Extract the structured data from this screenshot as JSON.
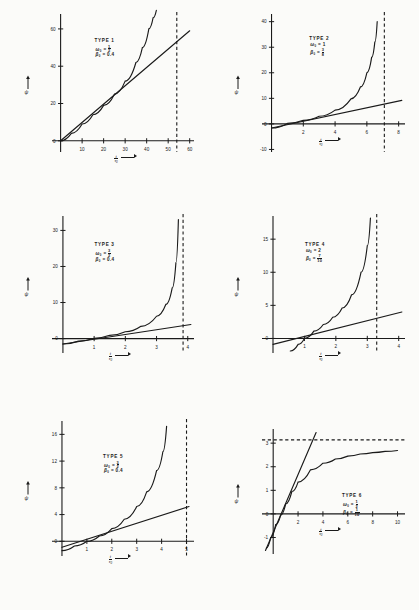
{
  "figure": {
    "kind": "six-panel-scientific-plot",
    "axis": {
      "x_label_main": "t",
      "x_label_sub": "0",
      "x_label_denom": "τ",
      "y_label": "ψ",
      "arrow": "→"
    },
    "ink": "#1a1a1a",
    "paper": "#fbfbf9"
  },
  "chart_data": [
    {
      "type": "line",
      "title": "TYPE 1",
      "params": {
        "omega0": "1/2",
        "beta0": "0.4"
      },
      "xlabel": "t/τ0",
      "ylabel": "ψ",
      "xlim": [
        -4,
        62
      ],
      "ylim": [
        -6,
        68
      ],
      "xticks": [
        10,
        20,
        30,
        40,
        50,
        60
      ],
      "yticks": [
        0,
        20,
        40,
        60
      ],
      "asymptote_type": "vertical",
      "asymptote_value": 54,
      "series": [
        {
          "name": "curve",
          "x": [
            0,
            5,
            10,
            15,
            20,
            25,
            30,
            35,
            38,
            41,
            43,
            44.5
          ],
          "y": [
            0,
            4,
            9,
            14,
            19,
            25,
            32,
            42,
            50,
            60,
            66,
            70
          ]
        },
        {
          "name": "line",
          "x": [
            0,
            60
          ],
          "y": [
            0,
            59
          ]
        }
      ]
    },
    {
      "type": "line",
      "title": "TYPE 2",
      "params": {
        "omega0": "1",
        "beta0": "3/8"
      },
      "xlabel": "t/τ0",
      "ylabel": "ψ",
      "xlim": [
        -0.6,
        8.4
      ],
      "ylim": [
        -11,
        43
      ],
      "xticks": [
        2,
        4,
        6,
        8
      ],
      "yticks": [
        -10,
        0,
        10,
        20,
        30,
        40
      ],
      "asymptote_type": "vertical",
      "asymptote_value": 7.1,
      "series": [
        {
          "name": "curve",
          "x": [
            0,
            1,
            2,
            3,
            4,
            5,
            5.6,
            6,
            6.3,
            6.5,
            6.65
          ],
          "y": [
            -1.6,
            0.2,
            1.4,
            3.0,
            5.4,
            9.8,
            14.5,
            20,
            26,
            32,
            40
          ]
        },
        {
          "name": "line",
          "x": [
            0,
            8.2
          ],
          "y": [
            -1.6,
            9.2
          ]
        }
      ]
    },
    {
      "type": "line",
      "title": "TYPE 3",
      "params": {
        "omega0": "3/2",
        "beta0": "0.4"
      },
      "xlabel": "t/τ0",
      "ylabel": "ψ",
      "xlim": [
        -0.35,
        4.2
      ],
      "ylim": [
        -4,
        34
      ],
      "xticks": [
        1,
        2,
        3,
        4
      ],
      "yticks": [
        0,
        10,
        20,
        30
      ],
      "asymptote_type": "vertical",
      "asymptote_value": 3.85,
      "series": [
        {
          "name": "curve",
          "x": [
            0,
            0.5,
            1,
            1.5,
            2,
            2.5,
            3,
            3.3,
            3.5,
            3.62,
            3.7
          ],
          "y": [
            -1.5,
            -0.7,
            0.1,
            0.9,
            1.9,
            3.4,
            6.2,
            9.5,
            14,
            21,
            33
          ]
        },
        {
          "name": "line",
          "x": [
            0,
            4.1
          ],
          "y": [
            -1.5,
            3.9
          ]
        }
      ]
    },
    {
      "type": "line",
      "title": "TYPE 4",
      "params": {
        "omega0": "2",
        "beta0": "7/10"
      },
      "xlabel": "t/τ0",
      "ylabel": "ψ",
      "xlim": [
        -0.35,
        4.2
      ],
      "ylim": [
        -2.2,
        18.5
      ],
      "xticks": [
        1,
        2,
        3,
        4
      ],
      "yticks": [
        0,
        5,
        10,
        15
      ],
      "asymptote_type": "vertical",
      "asymptote_value": 3.3,
      "series": [
        {
          "name": "curve",
          "x": [
            0.55,
            0.8,
            1,
            1.3,
            1.6,
            1.9,
            2.2,
            2.5,
            2.8,
            3.0,
            3.1
          ],
          "y": [
            -1.9,
            -0.9,
            0,
            1.1,
            2.1,
            3.2,
            4.6,
            6.6,
            10.0,
            14.0,
            18.2
          ]
        },
        {
          "name": "line",
          "x": [
            0,
            4.1
          ],
          "y": [
            -0.9,
            4.0
          ]
        }
      ]
    },
    {
      "type": "line",
      "title": "TYPE 5",
      "params": {
        "omega0": "3/2",
        "beta0": "0.4"
      },
      "xlabel": "t/τ0",
      "ylabel": "ψ",
      "xlim": [
        -0.4,
        5.3
      ],
      "ylim": [
        -2.2,
        18
      ],
      "xticks": [
        1,
        2,
        3,
        4,
        5
      ],
      "yticks": [
        0,
        4,
        8,
        12,
        16
      ],
      "asymptote_type": "vertical",
      "asymptote_value": 5.0,
      "series": [
        {
          "name": "curve",
          "x": [
            0,
            0.5,
            1,
            1.5,
            2,
            2.5,
            3,
            3.4,
            3.8,
            4.05,
            4.2
          ],
          "y": [
            -1.4,
            -0.7,
            0,
            0.8,
            1.9,
            3.3,
            5.2,
            7.4,
            10.6,
            13.4,
            17.2
          ]
        },
        {
          "name": "line",
          "x": [
            0,
            5.1
          ],
          "y": [
            -0.9,
            5.2
          ]
        }
      ]
    },
    {
      "type": "line",
      "title": "TYPE 6",
      "params": {
        "omega0": "1/2",
        "beta0": "1/10"
      },
      "xlabel": "t/τ0",
      "ylabel": "ψ",
      "xlim": [
        -0.9,
        10.6
      ],
      "ylim": [
        -1.7,
        3.6
      ],
      "xticks": [
        2,
        4,
        6,
        8,
        10
      ],
      "yticks": [
        -1,
        0,
        1,
        2,
        3
      ],
      "asymptote_type": "horizontal",
      "asymptote_value": 3.14,
      "series": [
        {
          "name": "curve",
          "x": [
            -0.55,
            -0.2,
            0.2,
            0.6,
            1,
            1.5,
            2,
            3,
            4,
            5,
            6,
            7,
            8,
            9,
            10
          ],
          "y": [
            -1.45,
            -1.0,
            -0.45,
            -0.05,
            0.42,
            0.95,
            1.35,
            1.87,
            2.15,
            2.33,
            2.45,
            2.54,
            2.6,
            2.65,
            2.69
          ]
        },
        {
          "name": "line",
          "x": [
            -0.62,
            3.45
          ],
          "y": [
            -1.55,
            3.45
          ]
        }
      ]
    }
  ]
}
